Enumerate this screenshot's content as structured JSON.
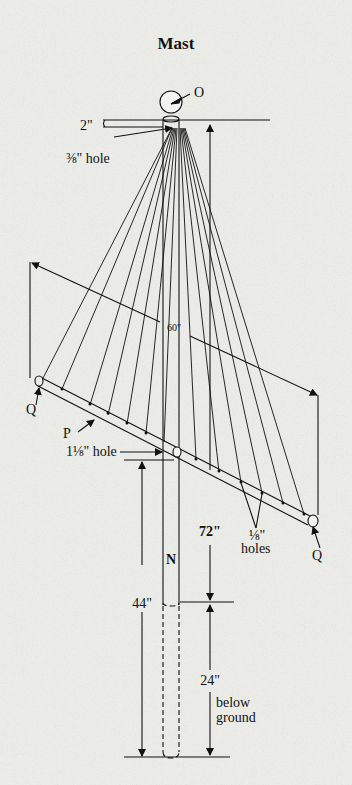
{
  "title": "Mast",
  "labels": {
    "ball": "O",
    "top_dim": "2\"",
    "top_hole": "⅜\" hole",
    "span": "60\"",
    "end_left": "Q",
    "end_right": "Q",
    "crossbar": "P",
    "center_hole": "1⅛\" hole",
    "holes_size": "⅛\"",
    "holes_word": "holes",
    "height_above": "72\"",
    "pole": "N",
    "height_crossbar": "44\"",
    "depth": "24\"",
    "below_1": "below",
    "below_2": "ground"
  },
  "colors": {
    "background": "#ebebe8",
    "ink": "#111111"
  }
}
